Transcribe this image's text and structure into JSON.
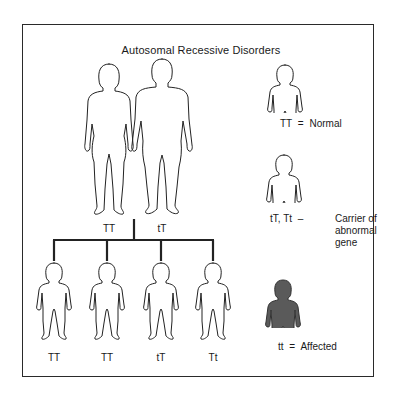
{
  "title": "Autosomal Recessive Disorders",
  "parents": [
    {
      "sex": "female",
      "genotype": "TT"
    },
    {
      "sex": "male",
      "genotype": "tT"
    }
  ],
  "children": [
    {
      "genotype": "TT",
      "status": "normal"
    },
    {
      "genotype": "TT",
      "status": "normal"
    },
    {
      "genotype": "tT",
      "status": "carrier"
    },
    {
      "genotype": "Tt",
      "status": "carrier"
    }
  ],
  "legend": [
    {
      "genotype": "TT",
      "separator": "=",
      "meaning_lines": [
        "Normal"
      ],
      "style": "outline"
    },
    {
      "genotype": "tT, Tt",
      "separator": "–",
      "meaning_lines": [
        "Carrier of",
        "abnormal",
        "gene"
      ],
      "style": "outline"
    },
    {
      "genotype": "tt",
      "separator": "=",
      "meaning_lines": [
        "Affected"
      ],
      "style": "filled"
    }
  ],
  "colors": {
    "line": "#222222",
    "affected_fill": "#5a5a5a",
    "background": "#ffffff"
  }
}
